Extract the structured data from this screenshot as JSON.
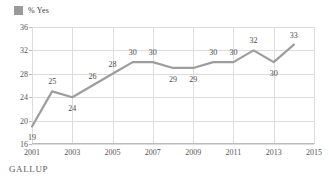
{
  "legend": {
    "swatch_color": "#9a9a9a",
    "label": "% Yes"
  },
  "source": {
    "label": "GALLUP"
  },
  "chart_data": {
    "type": "line",
    "title": "",
    "subtitle": "",
    "xlabel": "",
    "ylabel": "",
    "x": [
      2001,
      2002,
      2003,
      2004,
      2005,
      2006,
      2007,
      2008,
      2009,
      2010,
      2011,
      2012,
      2013,
      2014
    ],
    "values": [
      19,
      25,
      24,
      26,
      28,
      30,
      30,
      29,
      29,
      30,
      30,
      32,
      30,
      33
    ],
    "point_labels": [
      "19",
      "25",
      "24",
      "26",
      "28",
      "30",
      "30",
      "29",
      "29",
      "30",
      "30",
      "32",
      "30",
      "33"
    ],
    "point_label_side": [
      "below",
      "above",
      "below",
      "above",
      "above",
      "above",
      "above",
      "below",
      "below",
      "above",
      "above",
      "above",
      "below",
      "above"
    ],
    "series": [
      {
        "name": "% Yes",
        "color": "#9d9d9d",
        "values": [
          19,
          25,
          24,
          26,
          28,
          30,
          30,
          29,
          29,
          30,
          30,
          32,
          30,
          33
        ]
      }
    ],
    "xlim": [
      2001,
      2015
    ],
    "ylim": [
      16,
      36
    ],
    "yticks": [
      16,
      20,
      24,
      28,
      32,
      36
    ],
    "ytick_labels": [
      "16",
      "20",
      "24",
      "28",
      "32",
      "36"
    ],
    "xticks": [
      2001,
      2003,
      2005,
      2007,
      2009,
      2011,
      2013,
      2015
    ],
    "xtick_labels": [
      "2001",
      "2003",
      "2005",
      "2007",
      "2009",
      "2011",
      "2013",
      "2015"
    ],
    "grid": true,
    "grid_color": "#dcdcdc",
    "legend_position": "top-left"
  }
}
